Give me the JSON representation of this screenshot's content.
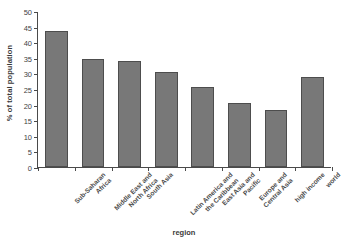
{
  "chart_data": {
    "type": "bar",
    "title": "",
    "xlabel": "region",
    "ylabel": "% of total population",
    "categories": [
      "Sub-Saharan Africa",
      "Middle East and North Africa",
      "South Asia",
      "Latin America and the Caribbean",
      "East Asia and Pacific",
      "Europe and Central Asia",
      "high income",
      "world"
    ],
    "category_lines": [
      [
        "Sub-Saharan",
        "Africa"
      ],
      [
        "Middle East and",
        "North Africa"
      ],
      [
        "South Asia"
      ],
      [
        "Latin America and",
        "the Caribbean"
      ],
      [
        "East Asia and",
        "Pacific"
      ],
      [
        "Europe and",
        "Central Asia"
      ],
      [
        "high income"
      ],
      [
        "world"
      ]
    ],
    "values": [
      43.7,
      34.6,
      33.9,
      30.5,
      25.8,
      20.6,
      18.4,
      29.0
    ],
    "ylim": [
      0,
      50
    ],
    "yticks": [
      0,
      5,
      10,
      15,
      20,
      25,
      30,
      35,
      40,
      45,
      50
    ],
    "ytick_labels": [
      "0",
      "5",
      "10",
      "15",
      "20",
      "25",
      "30",
      "35",
      "40",
      "45",
      "50"
    ],
    "grid": false,
    "legend": false,
    "bar_color": "#787878",
    "bar_edge_color": "#4d4d4d",
    "axis_color": "#4a4a4a",
    "background": "#ffffff"
  }
}
